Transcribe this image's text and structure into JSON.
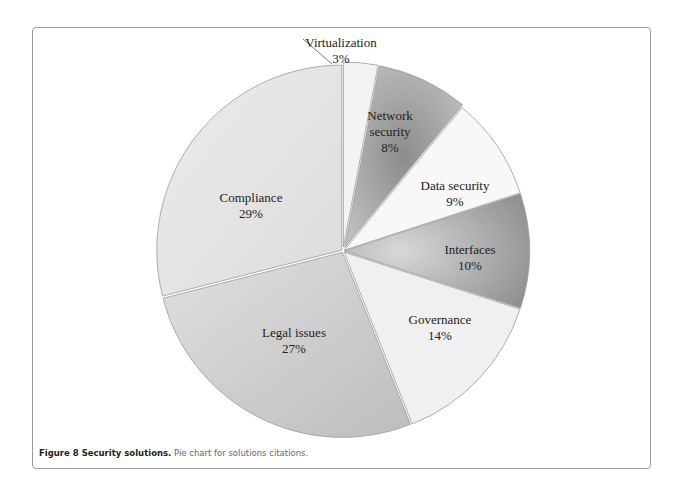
{
  "caption": {
    "label": "Figure 8 Security solutions.",
    "text": " Pie chart for solutions citations."
  },
  "chart_data": {
    "type": "pie",
    "title": "",
    "categories": [
      "Virtualization",
      "Network security",
      "Data security",
      "Interfaces",
      "Governance",
      "Legal issues",
      "Compliance"
    ],
    "values": [
      3,
      8,
      9,
      10,
      14,
      27,
      29
    ],
    "unit": "%",
    "start_angle": "12 o'clock, clockwise",
    "colors": [
      "#f2f2f2",
      "#a6a6a6",
      "#f7f7f7",
      "#b0b0b0",
      "#f0f0f0",
      "#cfcfcf",
      "#e6e6e6"
    ],
    "legend": "none (inline labels)"
  },
  "labels": [
    {
      "name": "Virtualization",
      "pct": "3%"
    },
    {
      "name": "Network",
      "name2": "security",
      "pct": "8%"
    },
    {
      "name": "Data security",
      "pct": "9%"
    },
    {
      "name": "Interfaces",
      "pct": "10%"
    },
    {
      "name": "Governance",
      "pct": "14%"
    },
    {
      "name": "Legal issues",
      "pct": "27%"
    },
    {
      "name": "Compliance",
      "pct": "29%"
    }
  ]
}
